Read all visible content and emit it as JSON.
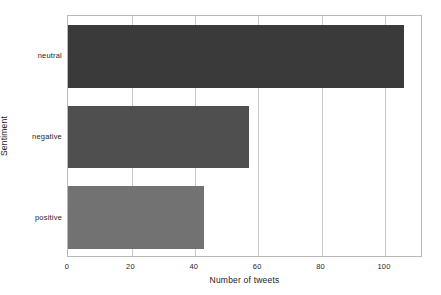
{
  "chart_data": {
    "type": "bar",
    "orientation": "horizontal",
    "title": "",
    "xlabel": "Number of tweets",
    "ylabel": "Sentiment",
    "categories": [
      "positive",
      "negative",
      "neutral"
    ],
    "values": [
      43,
      57,
      106
    ],
    "xlim": [
      0,
      112
    ],
    "ylim": [
      0,
      3
    ],
    "xticks": [
      0,
      20,
      40,
      60,
      80,
      100
    ],
    "xtick_labels": [
      "0",
      "20",
      "40",
      "60",
      "80",
      "100"
    ],
    "ytick_labels": [
      "positive",
      "negative",
      "neutral"
    ],
    "grid": "vertical",
    "legend": "none",
    "bar_colors": [
      "#727272",
      "#4f4f4f",
      "#3a3a3a"
    ],
    "background_color": "#ffffff",
    "frame_color": "#b9b9b9",
    "gridline_color": "#c9c9c9"
  }
}
